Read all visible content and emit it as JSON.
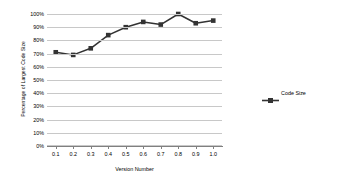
{
  "chart_data": {
    "type": "line",
    "title": "",
    "xlabel": "Version Number",
    "ylabel": "Percentage of Largest Code Size",
    "x": [
      0.1,
      0.2,
      0.3,
      0.4,
      0.5,
      0.6,
      0.7,
      0.8,
      0.9,
      1.0
    ],
    "xticklabels": [
      "0.1",
      "0.2",
      "0.3",
      "0.4",
      "0.5",
      "0.6",
      "0.7",
      "0.8",
      "0.9",
      "1.0"
    ],
    "yticklabels": [
      "0%",
      "10%",
      "20%",
      "30%",
      "40%",
      "50%",
      "60%",
      "70%",
      "80%",
      "90%",
      "100%"
    ],
    "ytickvalues": [
      0,
      10,
      20,
      30,
      40,
      50,
      60,
      70,
      80,
      90,
      100
    ],
    "ylim": [
      0,
      100
    ],
    "xlim": [
      0.05,
      1.05
    ],
    "grid": "horizontal",
    "legend_position": "right",
    "series": [
      {
        "name": "Code Size",
        "color": "#333333",
        "marker": "square",
        "values": [
          71,
          69,
          74,
          84,
          90,
          94,
          92,
          100,
          93,
          95
        ]
      }
    ]
  },
  "legend": {
    "entries": [
      {
        "label": "Code Size",
        "color": "#333333"
      }
    ]
  },
  "axes": {
    "x_title": "Version Number",
    "y_title": "Percentage of Largest Code Size"
  }
}
